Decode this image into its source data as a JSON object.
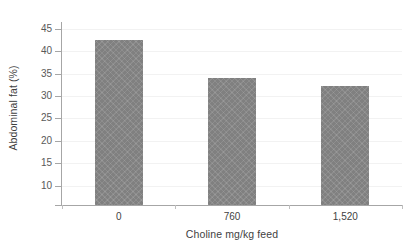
{
  "chart_data": {
    "type": "bar",
    "title": "",
    "categories": [
      "0",
      "760",
      "1,520"
    ],
    "values": [
      42.6,
      34.0,
      32.3
    ],
    "series": [
      {
        "name": "Abdominal fat",
        "values": [
          42.6,
          34.0,
          32.3
        ]
      }
    ],
    "xlabel": "Choline mg/kg feed",
    "ylabel": "Abdominal fat (%)",
    "ylim": [
      5.5,
      46.5
    ],
    "y_ticks": [
      "45",
      "40",
      "35",
      "30",
      "25",
      "20",
      "15",
      "10"
    ],
    "y_tick_values": [
      45,
      40,
      35,
      30,
      25,
      20,
      15,
      10
    ],
    "grid": true,
    "legend": "none",
    "bar_color": "#808080",
    "gridline_color": "#f2f2f2",
    "axis_color": "#a6a6a6",
    "text_color": "#3f3f3f"
  }
}
